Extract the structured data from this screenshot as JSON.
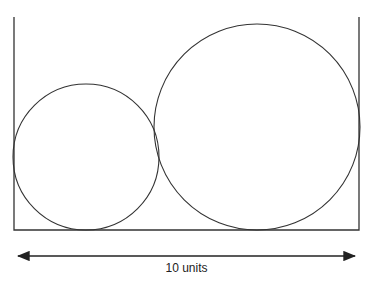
{
  "diagram": {
    "title": "",
    "container": {
      "left_x": 14,
      "right_x": 359,
      "top_y": 17,
      "bottom_y": 230
    },
    "circles": [
      {
        "name": "small-circle",
        "cx": 86,
        "cy": 157,
        "r": 73
      },
      {
        "name": "large-circle",
        "cx": 257,
        "cy": 127,
        "r": 103
      }
    ],
    "dimension": {
      "label": "10 units",
      "x1": 14,
      "x2": 359,
      "y": 256
    },
    "stroke_color": "#333333"
  }
}
